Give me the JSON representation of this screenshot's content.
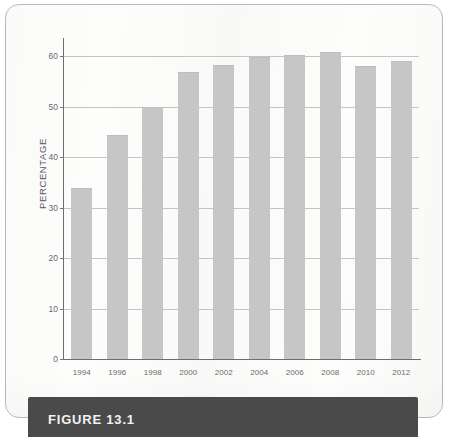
{
  "figure": {
    "caption": "FIGURE 13.1"
  },
  "chart_data": {
    "type": "bar",
    "title": "",
    "xlabel": "",
    "ylabel": "PERCENTAGE",
    "categories": [
      "1994",
      "1996",
      "1998",
      "2000",
      "2002",
      "2004",
      "2006",
      "2008",
      "2010",
      "2012"
    ],
    "values": [
      33.8,
      44.4,
      50.0,
      56.8,
      58.2,
      59.9,
      60.3,
      60.8,
      58.0,
      59.0
    ],
    "ylim": [
      0,
      62
    ],
    "yticks": [
      0,
      10,
      20,
      30,
      40,
      50,
      60
    ],
    "ytick_labels": [
      "0",
      "10",
      "20",
      "30",
      "40",
      "50",
      "60"
    ],
    "grid": true,
    "legend": "none",
    "bar_color": "#c6c6c6",
    "axis_color": "#6d6d70",
    "gridline_color": "#c4c4c4"
  }
}
